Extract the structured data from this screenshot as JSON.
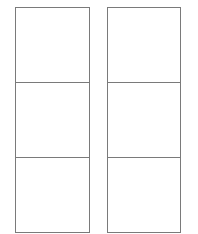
{
  "layout": {
    "columns": [
      {
        "name": "left-column",
        "panels": [
          {
            "label": ""
          },
          {
            "label": ""
          },
          {
            "label": ""
          }
        ]
      },
      {
        "name": "right-column",
        "panels": [
          {
            "label": ""
          },
          {
            "label": ""
          },
          {
            "label": ""
          }
        ]
      }
    ]
  },
  "colors": {
    "border": "#7a7a7a",
    "background": "#ffffff"
  }
}
